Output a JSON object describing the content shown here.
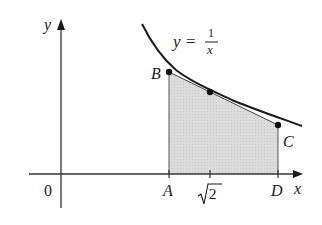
{
  "diagram": {
    "type": "function-area-trapezoid",
    "function_label": {
      "lhs": "y",
      "eq": "=",
      "numerator": "1",
      "denominator": "x"
    },
    "axes": {
      "x_label": "x",
      "y_label": "y",
      "origin_label": "0"
    },
    "x_ticks": [
      {
        "label": "A",
        "italic": true
      },
      {
        "label": "2",
        "radical": true
      },
      {
        "label": "D",
        "italic": true
      }
    ],
    "points": [
      {
        "label": "B"
      },
      {
        "label": "C"
      }
    ],
    "colors": {
      "stroke": "#1a1a1a",
      "shade": "#d9d9d9",
      "background": "#ffffff"
    }
  }
}
